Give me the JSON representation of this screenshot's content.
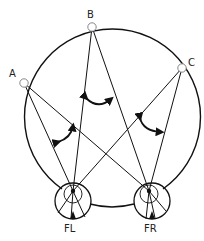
{
  "diagram": {
    "sources": [
      {
        "label": "A",
        "x": 24,
        "y": 83
      },
      {
        "label": "B",
        "x": 92,
        "y": 27
      },
      {
        "label": "C",
        "x": 182,
        "y": 68
      }
    ],
    "receivers": [
      {
        "label": "FL",
        "cx": 73,
        "cy": 198,
        "pivot_x": 73,
        "pivot_y": 191
      },
      {
        "label": "FR",
        "cx": 150,
        "cy": 198,
        "pivot_x": 149,
        "pivot_y": 191
      }
    ],
    "colors": {
      "stroke": "#111111",
      "background": "#ffffff",
      "label": "#222222"
    }
  },
  "labels": {
    "a": "A",
    "b": "B",
    "c": "C",
    "fl": "FL",
    "fr": "FR"
  }
}
